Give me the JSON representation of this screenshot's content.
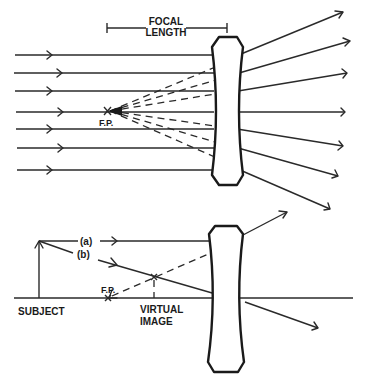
{
  "figure": {
    "colors": {
      "ink": "#1a1a1a",
      "background": "#ffffff"
    }
  },
  "top_diagram": {
    "focal_length_label_line1": "FOCAL",
    "focal_length_label_line2": "LENGTH",
    "focal_point_label": "F.P.",
    "incoming_ray_y": [
      55,
      73,
      91,
      112,
      129,
      148,
      170
    ],
    "outgoing_ray_count": 7
  },
  "bottom_diagram": {
    "ray_a_label": "(a)",
    "ray_b_label": "(b)",
    "subject_label": "SUBJECT",
    "focal_point_label": "F.P.",
    "virtual_image_label_line1": "VIRTUAL",
    "virtual_image_label_line2": "IMAGE"
  }
}
